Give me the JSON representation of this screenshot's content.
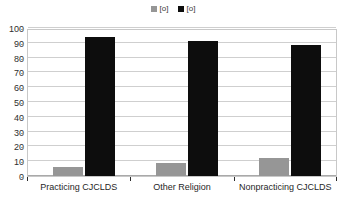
{
  "chart_data": {
    "type": "bar",
    "title": "",
    "subtitle": "",
    "xlabel": "",
    "ylabel": "",
    "ylim": [
      0,
      100
    ],
    "ytick_step": 10,
    "yticks": [
      100,
      90,
      80,
      70,
      60,
      50,
      40,
      30,
      20,
      10,
      0
    ],
    "grid": true,
    "legend_position": "top-center",
    "categories": [
      "Practicing CJCLDS",
      "Other Religion",
      "Nonpracticing CJCLDS"
    ],
    "series": [
      {
        "name": "[o]",
        "color": "#969696",
        "values": [
          6,
          9,
          12
        ]
      },
      {
        "name": "[o]",
        "color": "#0d0d0d",
        "values": [
          94,
          91,
          88.5
        ]
      }
    ]
  },
  "legend": {
    "entries": [
      {
        "label": "[o]",
        "color": "#969696"
      },
      {
        "label": "[o]",
        "color": "#0d0d0d"
      }
    ]
  },
  "axes": {
    "y": {
      "labels": [
        "100",
        "90",
        "80",
        "70",
        "60",
        "50",
        "40",
        "30",
        "20",
        "10",
        "0"
      ]
    },
    "x": {
      "labels": [
        "Practicing CJCLDS",
        "Other Religion",
        "Nonpracticing CJCLDS"
      ]
    }
  },
  "colors": {
    "series_a": "#969696",
    "series_b": "#0d0d0d",
    "gridline": "#cfcfcf",
    "frame": "#c8c8c8",
    "background": "#ffffff",
    "text": "#1f1f1f"
  }
}
